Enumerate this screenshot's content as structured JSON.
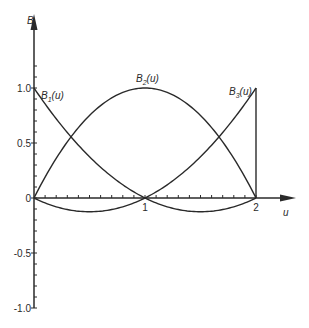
{
  "chart_data": {
    "type": "line",
    "title": "",
    "xlabel": "u",
    "ylabel": "B",
    "xlim": [
      0,
      2
    ],
    "ylim": [
      -1.0,
      1.0
    ],
    "grid": false,
    "legend": "inline labels",
    "x_ticks": [
      {
        "value": 1,
        "label": "1"
      },
      {
        "value": 2,
        "label": "2"
      }
    ],
    "y_ticks": [
      {
        "value": 1.0,
        "label": "1.0"
      },
      {
        "value": 0.5,
        "label": "0.5"
      },
      {
        "value": 0,
        "label": "0"
      },
      {
        "value": -0.5,
        "label": "-0.5"
      },
      {
        "value": -1.0,
        "label": "-1.0"
      }
    ],
    "x": [
      0,
      0.25,
      0.5,
      0.75,
      1.0,
      1.25,
      1.5,
      1.75,
      2.0
    ],
    "series": [
      {
        "name": "B1(u)",
        "label": "B",
        "sub": "1",
        "suffix": "(u)",
        "formula": "(1-u)(2-u)/2",
        "values": [
          1.0,
          0.656,
          0.375,
          0.156,
          0.0,
          -0.094,
          -0.125,
          -0.094,
          0.0
        ]
      },
      {
        "name": "B2(u)",
        "label": "B",
        "sub": "2",
        "suffix": "(u)",
        "formula": "u(2-u)",
        "values": [
          0.0,
          0.438,
          0.75,
          0.938,
          1.0,
          0.938,
          0.75,
          0.438,
          0.0
        ]
      },
      {
        "name": "B3(u)",
        "label": "B",
        "sub": "3",
        "suffix": "(u)",
        "formula": "u(u-1)/2",
        "values": [
          0.0,
          -0.094,
          -0.125,
          -0.094,
          0.0,
          0.156,
          0.375,
          0.656,
          1.0
        ]
      }
    ],
    "annotations": [
      "vertical drop of B3 from 1.0 to 0 at u=2"
    ]
  },
  "axes": {
    "x_label": "u",
    "y_label": "B"
  },
  "colors": {
    "line": "#2a2a2a",
    "background": "#ffffff"
  }
}
